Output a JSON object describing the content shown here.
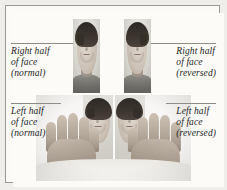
{
  "figure": {
    "background_color": "#fcfbf8",
    "border_color": "#9a9a93",
    "text_color": "#1d1d1d",
    "leader_line_color": "#8d8d86",
    "rendering": "grayscale photograph"
  },
  "labels": {
    "top_left": {
      "line1": "Right half",
      "line2": "of face",
      "line3": "(normal)"
    },
    "top_right": {
      "line1": "Right half",
      "line2": "of face",
      "line3": "(reversed)"
    },
    "bottom_left": {
      "line1": "Left half",
      "line2": "of face",
      "line3": "(normal)"
    },
    "bottom_right": {
      "line1": "Left half",
      "line2": "of face",
      "line3": "(reversed)"
    }
  },
  "photos": {
    "top_left_portrait": "half-face-portrait-normal",
    "top_right_portrait": "half-face-portrait-reversed",
    "bottom_composite_left": "left-half-composite-normal",
    "bottom_composite_right": "left-half-composite-reversed",
    "hands": "hands-holding-mirror-icon"
  }
}
